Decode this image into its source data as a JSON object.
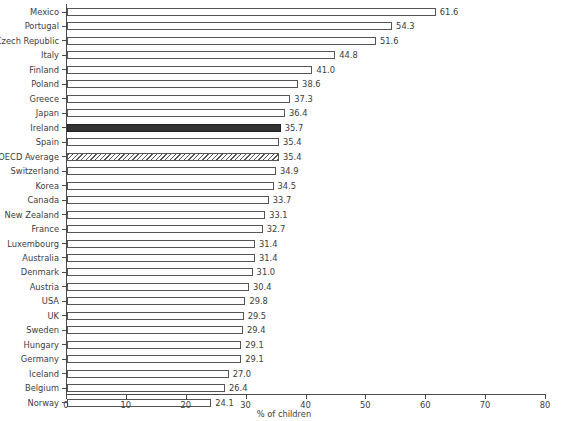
{
  "chart_data": {
    "type": "bar",
    "orientation": "horizontal",
    "title": "",
    "subtitle": "",
    "xlabel": "% of children",
    "ylabel": "",
    "xlim": [
      0,
      80
    ],
    "xticks": [
      0,
      10,
      20,
      30,
      40,
      50,
      60,
      70,
      80
    ],
    "grid": false,
    "legend": null,
    "categories": [
      "Mexico",
      "Portugal",
      "Czech Republic",
      "Italy",
      "Finland",
      "Poland",
      "Greece",
      "Japan",
      "Ireland",
      "Spain",
      "OECD Average",
      "Switzerland",
      "Korea",
      "Canada",
      "New Zealand",
      "France",
      "Luxembourg",
      "Australia",
      "Denmark",
      "Austria",
      "USA",
      "UK",
      "Sweden",
      "Hungary",
      "Germany",
      "Iceland",
      "Belgium",
      "Norway"
    ],
    "values": [
      61.6,
      54.3,
      51.6,
      44.8,
      41.0,
      38.6,
      37.3,
      36.4,
      35.7,
      35.4,
      35.4,
      34.9,
      34.5,
      33.7,
      33.1,
      32.7,
      31.4,
      31.4,
      31.0,
      30.4,
      29.8,
      29.5,
      29.4,
      29.1,
      29.1,
      27.0,
      26.4,
      24.1
    ],
    "value_labels": [
      "61.6",
      "54.3",
      "51.6",
      "44.8",
      "41.0",
      "38.6",
      "37.3",
      "36.4",
      "35.7",
      "35.4",
      "35.4",
      "34.9",
      "34.5",
      "33.7",
      "33.1",
      "32.7",
      "31.4",
      "31.4",
      "31.0",
      "30.4",
      "29.8",
      "29.5",
      "29.4",
      "29.1",
      "29.1",
      "27.0",
      "26.4",
      "24.1"
    ],
    "bar_styles": [
      "plain",
      "plain",
      "plain",
      "plain",
      "plain",
      "plain",
      "plain",
      "plain",
      "highlight",
      "plain",
      "hatched",
      "plain",
      "plain",
      "plain",
      "plain",
      "plain",
      "plain",
      "plain",
      "plain",
      "plain",
      "plain",
      "plain",
      "plain",
      "plain",
      "plain",
      "plain",
      "plain",
      "plain"
    ],
    "colors": {
      "bar_fill": "#ffffff",
      "bar_stroke": "#555555",
      "highlight_fill": "#333333",
      "hatch_stroke": "#555555",
      "axis": "#4a4a4a",
      "text": "#3d3d3d",
      "background": "#ffffff"
    }
  }
}
